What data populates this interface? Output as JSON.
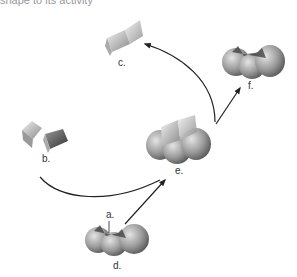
{
  "caption_top": "shape to its activity",
  "labels": {
    "a": "a.",
    "b": "b.",
    "c": "c.",
    "d": "d.",
    "e": "e.",
    "f": "f."
  },
  "colors": {
    "arrow": "#222222",
    "shape_dark": "#555555",
    "shape_mid": "#8a8a8a",
    "shape_light": "#cfcfcf"
  }
}
